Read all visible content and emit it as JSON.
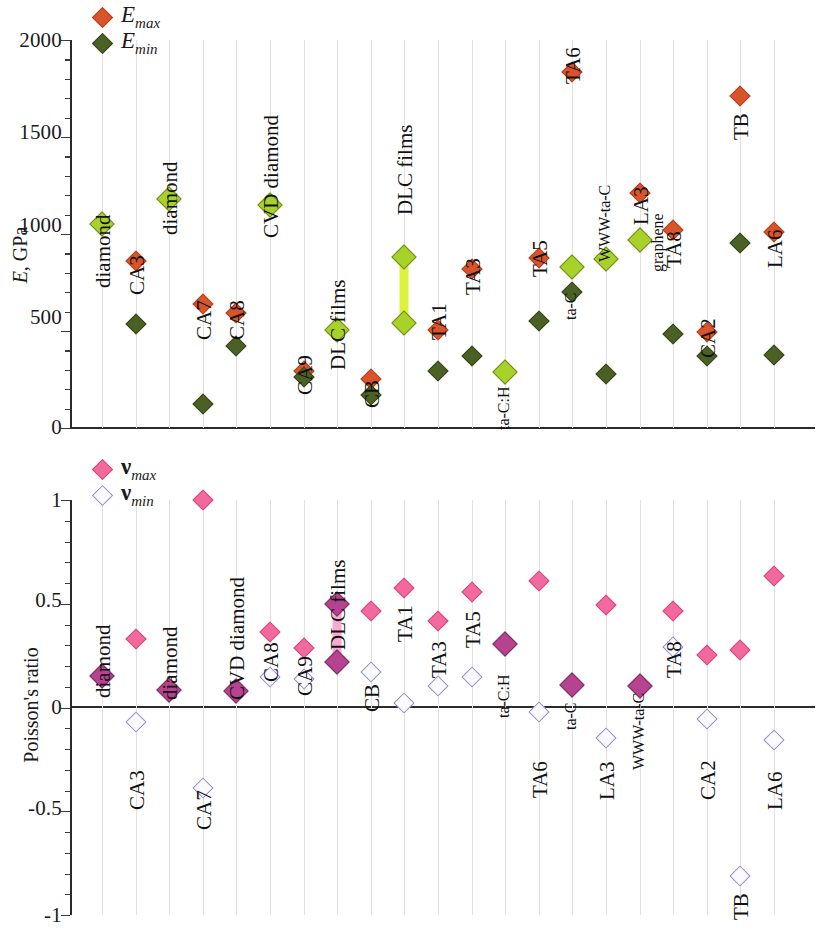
{
  "figure": {
    "panels": [
      {
        "id": "young-modulus",
        "axis": {
          "ylabel": "E, GPa",
          "ylabel_symbol": "E",
          "ylabel_unit": ", GPa",
          "yticks": [
            "0",
            "500",
            "1000",
            "1500",
            "2000"
          ],
          "ymin": 0,
          "ymax": 2000
        },
        "legend": [
          {
            "symbol": "diamond",
            "color": "#d9542b",
            "text": "E",
            "sub": "max"
          },
          {
            "symbol": "diamond",
            "color": "#4a6024",
            "text": "E",
            "sub": "min"
          }
        ]
      },
      {
        "id": "poissons-ratio",
        "axis": {
          "ylabel": "Poisson's ratio",
          "yticks": [
            "-1",
            "-0.5",
            "0",
            "0.5",
            "1"
          ],
          "ymin": -1,
          "ymax": 1
        },
        "legend": [
          {
            "symbol": "diamond",
            "color": "#f2699d",
            "text": "ν",
            "sub": "max"
          },
          {
            "symbol": "diamond",
            "color": "#fbfbff",
            "text": "ν",
            "sub": "min"
          }
        ]
      }
    ]
  },
  "chart_data": [
    {
      "type": "scatter",
      "title": "Young's modulus of carbon materials",
      "xlabel": "",
      "ylabel": "E, GPa",
      "ylim": [
        0,
        2000
      ],
      "yticks": [
        0,
        500,
        1000,
        1500,
        2000
      ],
      "grid": "vertical-faint",
      "legend": [
        "E_max",
        "E_min"
      ],
      "legend_position": "top-left",
      "series": [
        {
          "name": "E_max",
          "color": "#d9542b"
        },
        {
          "name": "E_min",
          "color": "#4a6024"
        },
        {
          "name": "E_max=E_min (isotropic)",
          "color": "#a8d12a"
        }
      ],
      "points": [
        {
          "label": "diamond",
          "x": 1,
          "E_max": 1050,
          "E_min": 1050,
          "isotropic": true
        },
        {
          "label": "CA3",
          "x": 2,
          "E_max": 860,
          "E_min": 535,
          "isotropic": false
        },
        {
          "label": "diamond",
          "x": 3,
          "E_max": 1180,
          "E_min": 1180,
          "isotropic": true
        },
        {
          "label": "CA7",
          "x": 4,
          "E_max": 640,
          "E_min": 125,
          "isotropic": false
        },
        {
          "label": "CA8",
          "x": 5,
          "E_max": 595,
          "E_min": 425,
          "isotropic": false
        },
        {
          "label": "CVD diamond",
          "x": 6,
          "E_max": 1150,
          "E_min": 1150,
          "isotropic": true
        },
        {
          "label": "CA9",
          "x": 7,
          "E_max": 295,
          "E_min": 262,
          "isotropic": false
        },
        {
          "label": "DLC films",
          "x": 8,
          "E_max": 505,
          "E_min": 505,
          "isotropic": true
        },
        {
          "label": "CB",
          "x": 9,
          "E_max": 255,
          "E_min": 172,
          "isotropic": false
        },
        {
          "label": "DLC films",
          "x": 10,
          "E_max": 880,
          "E_min": 540,
          "isotropic": true,
          "connector": "yellow-green"
        },
        {
          "label": "TA1",
          "x": 11,
          "E_max": 505,
          "E_min": 292,
          "isotropic": false
        },
        {
          "label": "TA3",
          "x": 12,
          "E_max": 822,
          "E_min": 372,
          "isotropic": false
        },
        {
          "label": "ta-C:H",
          "x": 13,
          "E_max": 290,
          "E_min": 290,
          "isotropic": true
        },
        {
          "label": "TA5",
          "x": 14,
          "E_max": 878,
          "E_min": 552,
          "isotropic": false
        },
        {
          "label": "ta-C",
          "x": 15,
          "E_max": 830,
          "E_min": 700,
          "isotropic": true
        },
        {
          "label": "WWW-ta-C",
          "x": 16,
          "E_max": 870,
          "E_min": 278,
          "isotropic": true
        },
        {
          "label": "LA3",
          "x": 17,
          "E_max": 1212,
          "E_min": 968,
          "isotropic": false
        },
        {
          "label": "graphene",
          "x": 17,
          "E_max": 968,
          "E_min": 968,
          "isotropic": true
        },
        {
          "label": "TA8",
          "x": 18,
          "E_max": 1022,
          "E_min": 485,
          "isotropic": false
        },
        {
          "label": "CA2",
          "x": 19,
          "E_max": 495,
          "E_min": 370,
          "isotropic": false
        },
        {
          "label": "TB",
          "x": 20,
          "E_max": 1710,
          "E_min": 955,
          "isotropic": false
        },
        {
          "label": "TA6",
          "x": 15,
          "E_max": 1835,
          "E_min": null,
          "isotropic": false
        },
        {
          "label": "LA6",
          "x": 21,
          "E_max": 1012,
          "E_min": 378,
          "isotropic": false
        }
      ]
    },
    {
      "type": "scatter",
      "title": "Poisson's ratio of carbon materials",
      "xlabel": "",
      "ylabel": "Poisson's ratio",
      "ylim": [
        -1,
        1
      ],
      "yticks": [
        -1,
        -0.5,
        0,
        0.5,
        1
      ],
      "grid": "vertical-faint",
      "legend": [
        "nu_max",
        "nu_min"
      ],
      "legend_position": "top-left",
      "series": [
        {
          "name": "nu_max",
          "color": "#f2699d"
        },
        {
          "name": "nu_min",
          "color": "#fbfbff"
        },
        {
          "name": "nu_max=nu_min",
          "color": "#b6438f"
        }
      ],
      "points": [
        {
          "label": "diamond",
          "x": 1,
          "nu_max": 0.15,
          "nu_min": 0.15,
          "coincident": true
        },
        {
          "label": "CA3",
          "x": 2,
          "nu_max": 0.33,
          "nu_min": -0.07,
          "coincident": false
        },
        {
          "label": "diamond",
          "x": 3,
          "nu_max": 0.085,
          "nu_min": 0.085,
          "coincident": true
        },
        {
          "label": "CA7",
          "x": 4,
          "nu_max": 1.0,
          "nu_min": -0.39,
          "coincident": false
        },
        {
          "label": "CVD diamond",
          "x": 5,
          "nu_max": 0.08,
          "nu_min": 0.08,
          "coincident": true
        },
        {
          "label": "CA8",
          "x": 6,
          "nu_max": 0.365,
          "nu_min": 0.145,
          "coincident": false
        },
        {
          "label": "CA9",
          "x": 7,
          "nu_max": 0.285,
          "nu_min": 0.135,
          "coincident": false
        },
        {
          "label": "DLC films",
          "x": 8,
          "nu_max": 0.5,
          "nu_min": 0.22,
          "coincident": true,
          "connector": "pink"
        },
        {
          "label": "CB",
          "x": 9,
          "nu_max": 0.465,
          "nu_min": 0.17,
          "coincident": false
        },
        {
          "label": "TA1",
          "x": 10,
          "nu_max": 0.575,
          "nu_min": 0.02,
          "coincident": false
        },
        {
          "label": "TA3",
          "x": 11,
          "nu_max": 0.415,
          "nu_min": 0.105,
          "coincident": false
        },
        {
          "label": "TA5",
          "x": 12,
          "nu_max": 0.555,
          "nu_min": 0.145,
          "coincident": false
        },
        {
          "label": "ta-C:H",
          "x": 13,
          "nu_max": 0.305,
          "nu_min": 0.305,
          "coincident": true
        },
        {
          "label": "TA6",
          "x": 14,
          "nu_max": 0.61,
          "nu_min": -0.02,
          "coincident": false
        },
        {
          "label": "ta-C",
          "x": 15,
          "nu_max": 0.11,
          "nu_min": 0.11,
          "coincident": true
        },
        {
          "label": "LA3",
          "x": 16,
          "nu_max": 0.495,
          "nu_min": -0.145,
          "coincident": false
        },
        {
          "label": "WWW-ta-C",
          "x": 17,
          "nu_max": 0.105,
          "nu_min": 0.105,
          "coincident": true
        },
        {
          "label": "TA8",
          "x": 18,
          "nu_max": 0.465,
          "nu_min": 0.29,
          "coincident": false
        },
        {
          "label": "CA2",
          "x": 19,
          "nu_max": 0.255,
          "nu_min": -0.055,
          "coincident": false
        },
        {
          "label": "TB",
          "x": 20,
          "nu_max": 0.275,
          "nu_min": -0.81,
          "coincident": false
        },
        {
          "label": "LA6",
          "x": 21,
          "nu_max": 0.635,
          "nu_min": -0.155,
          "coincident": false
        }
      ]
    }
  ]
}
